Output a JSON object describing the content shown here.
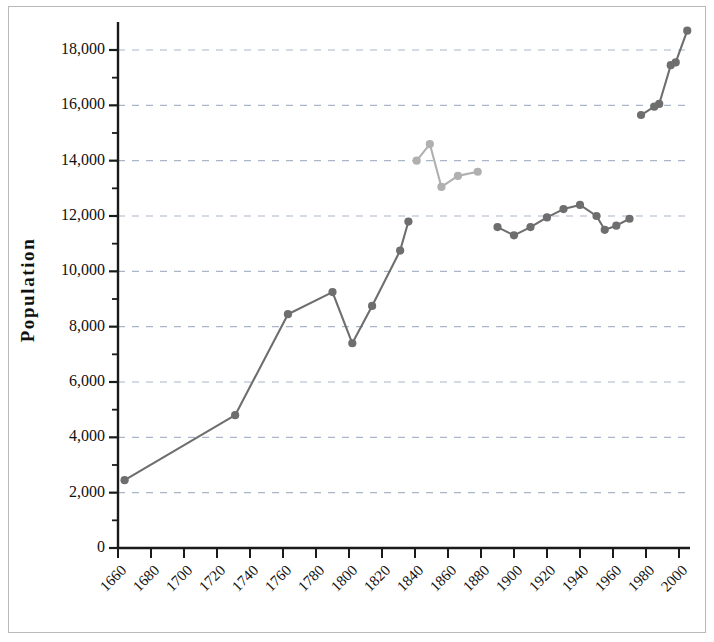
{
  "chart_data": {
    "type": "line",
    "title": "",
    "xlabel": "",
    "ylabel": "Population",
    "xlim": [
      1650,
      2010
    ],
    "ylim": [
      0,
      19000
    ],
    "grid": true,
    "grid_style": "dashed-horizontal",
    "legend": "none",
    "y_ticks_major": [
      0,
      2000,
      4000,
      6000,
      8000,
      10000,
      12000,
      14000,
      16000,
      18000
    ],
    "y_tick_labels": [
      "0",
      "2,000",
      "4,000",
      "6,000",
      "8,000",
      "10,000",
      "12,000",
      "14,000",
      "16,000",
      "18,000"
    ],
    "y_minor_tick_step": 1000,
    "x_ticks": [
      1660,
      1680,
      1700,
      1720,
      1740,
      1760,
      1780,
      1800,
      1820,
      1840,
      1860,
      1880,
      1900,
      1920,
      1940,
      1960,
      1980,
      2000
    ],
    "x_tick_labels": [
      "1660",
      "1680",
      "1700",
      "1720",
      "1740",
      "1760",
      "1780",
      "1800",
      "1820",
      "1840",
      "1860",
      "1880",
      "1900",
      "1920",
      "1940",
      "1960",
      "1980",
      "2000"
    ],
    "series": [
      {
        "name": "main-population",
        "color": "#6e6e6e",
        "marker": "circle",
        "segments": [
          {
            "name": "colonial-to-1836",
            "points": [
              {
                "x": 1664,
                "y": 2450
              },
              {
                "x": 1731,
                "y": 4800
              },
              {
                "x": 1763,
                "y": 8450
              },
              {
                "x": 1790,
                "y": 9250
              },
              {
                "x": 1802,
                "y": 7400
              },
              {
                "x": 1814,
                "y": 8750
              },
              {
                "x": 1831,
                "y": 10750
              },
              {
                "x": 1836,
                "y": 11800
              }
            ]
          },
          {
            "name": "modern-1890-1975",
            "points": [
              {
                "x": 1890,
                "y": 11600
              },
              {
                "x": 1900,
                "y": 11300
              },
              {
                "x": 1910,
                "y": 11600
              },
              {
                "x": 1920,
                "y": 11950
              },
              {
                "x": 1930,
                "y": 12250
              },
              {
                "x": 1940,
                "y": 12400
              },
              {
                "x": 1950,
                "y": 12000
              },
              {
                "x": 1955,
                "y": 11500
              },
              {
                "x": 1962,
                "y": 11650
              },
              {
                "x": 1970,
                "y": 11900
              }
            ]
          },
          {
            "name": "recent-1978-2005",
            "points": [
              {
                "x": 1977,
                "y": 15650
              },
              {
                "x": 1985,
                "y": 15950
              },
              {
                "x": 1988,
                "y": 16050
              },
              {
                "x": 1995,
                "y": 17450
              },
              {
                "x": 1998,
                "y": 17550
              },
              {
                "x": 2005,
                "y": 18700
              }
            ]
          }
        ]
      },
      {
        "name": "secondary-population",
        "color": "#b0b0b0",
        "marker": "circle",
        "segments": [
          {
            "name": "mid-1800s",
            "points": [
              {
                "x": 1841,
                "y": 14000
              },
              {
                "x": 1849,
                "y": 14600
              },
              {
                "x": 1856,
                "y": 13050
              },
              {
                "x": 1866,
                "y": 13450
              },
              {
                "x": 1878,
                "y": 13600
              }
            ]
          }
        ]
      }
    ]
  },
  "axes": {
    "y_axis_title": "Population"
  }
}
